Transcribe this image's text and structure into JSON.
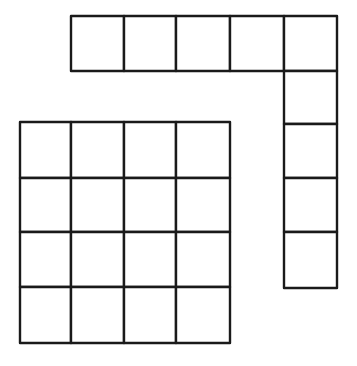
{
  "diagram": {
    "stroke_color": "#1a1a1a",
    "background": "#ffffff",
    "l_shape": {
      "horizontal_strip": {
        "cells": 5,
        "x": [
          71,
          124,
          176,
          230,
          284
        ],
        "y": 16,
        "size": 53,
        "height": 55
      },
      "vertical_strip": {
        "cells": 4,
        "x": 284,
        "y": [
          71,
          124,
          178,
          232
        ],
        "width": 53,
        "bottom": 288
      },
      "total_cells": 9
    },
    "grid": {
      "rows": 4,
      "cols": 4,
      "col_edges": [
        20,
        71,
        124,
        176,
        230
      ],
      "row_edges": [
        122,
        178,
        232,
        287,
        343
      ],
      "total_cells": 16
    }
  }
}
